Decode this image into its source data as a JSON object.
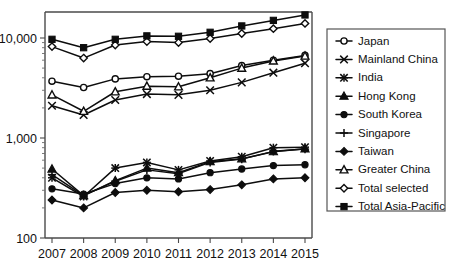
{
  "chart_data": {
    "type": "line",
    "title": "",
    "xlabel": "",
    "ylabel": "",
    "scale": "log",
    "grid": false,
    "legend_position": "right",
    "categories": [
      "2007",
      "2008",
      "2009",
      "2010",
      "2011",
      "2012",
      "2013",
      "2014",
      "2015"
    ],
    "x": [
      2007,
      2008,
      2009,
      2010,
      2011,
      2012,
      2013,
      2014,
      2015
    ],
    "ylim": [
      100,
      20000
    ],
    "ytick_labels": [
      "100",
      "1,000",
      "10,000"
    ],
    "ytick_values": [
      100,
      1000,
      10000
    ],
    "series": [
      {
        "name": "Japan",
        "marker": "open-circle",
        "values": [
          3700,
          3200,
          3900,
          4100,
          4150,
          4400,
          5300,
          6000,
          6700
        ]
      },
      {
        "name": "Mainland China",
        "marker": "x-cross",
        "values": [
          2100,
          1700,
          2400,
          2750,
          2700,
          3000,
          3600,
          4500,
          5600
        ]
      },
      {
        "name": "India",
        "marker": "asterisk",
        "values": [
          400,
          260,
          500,
          570,
          480,
          590,
          650,
          800,
          810
        ]
      },
      {
        "name": "Hong Kong",
        "marker": "filled-triangle",
        "values": [
          490,
          265,
          375,
          500,
          450,
          580,
          620,
          730,
          780
        ]
      },
      {
        "name": "South Korea",
        "marker": "filled-circle",
        "values": [
          310,
          275,
          350,
          400,
          390,
          450,
          490,
          530,
          540
        ]
      },
      {
        "name": "Singapore",
        "marker": "plus",
        "values": [
          430,
          265,
          370,
          480,
          440,
          570,
          615,
          735,
          775
        ]
      },
      {
        "name": "Taiwan",
        "marker": "filled-diamond",
        "values": [
          240,
          200,
          285,
          300,
          290,
          305,
          340,
          390,
          400
        ]
      },
      {
        "name": "Greater China",
        "marker": "open-triangle",
        "values": [
          2700,
          1850,
          2900,
          3300,
          3250,
          4000,
          5000,
          5900,
          6600
        ]
      },
      {
        "name": "Total selected",
        "marker": "open-diamond",
        "values": [
          8200,
          6300,
          8500,
          9200,
          9000,
          9900,
          11100,
          12400,
          14000
        ]
      },
      {
        "name": "Total Asia-Pacific",
        "marker": "filled-square",
        "values": [
          9700,
          8000,
          9700,
          10500,
          10400,
          11400,
          13200,
          15000,
          17000
        ]
      }
    ]
  },
  "colors": {
    "ink": "#0d0d0d",
    "axis": "#4a4a4a",
    "background": "#ffffff",
    "legend_border": "#555555"
  }
}
